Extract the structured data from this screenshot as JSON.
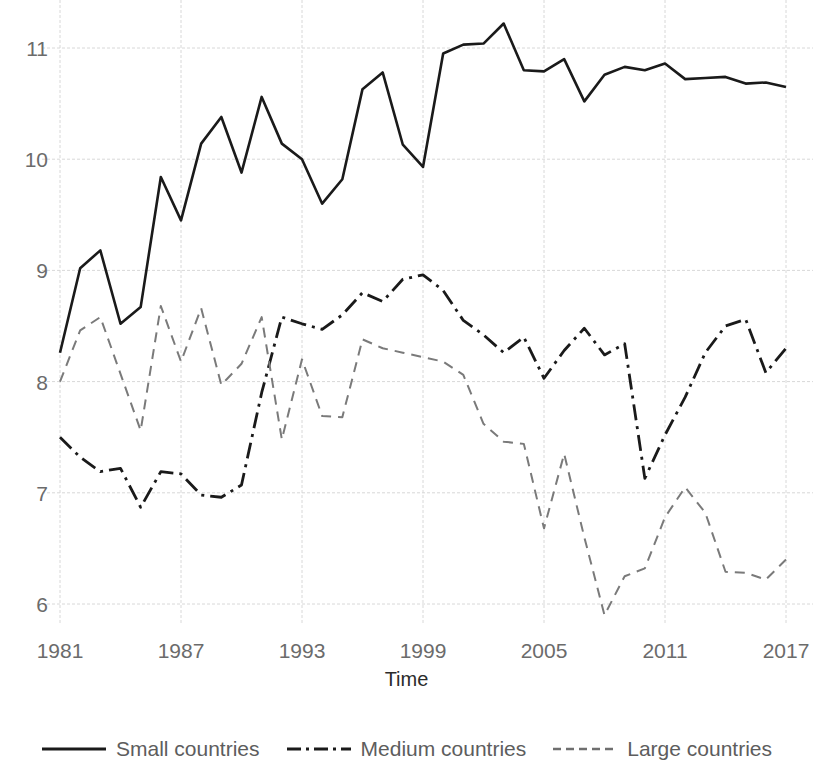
{
  "chart_data": {
    "type": "line",
    "title": "",
    "xlabel": "Time",
    "ylabel": "",
    "xlim": [
      1981,
      2017
    ],
    "ylim": [
      5.75,
      11.4
    ],
    "grid": true,
    "legend_position": "bottom",
    "x_ticks": [
      "1981",
      "1987",
      "1993",
      "1999",
      "2005",
      "2011",
      "2017"
    ],
    "y_ticks": [
      "6",
      "7",
      "8",
      "9",
      "10",
      "11"
    ],
    "x": [
      1981,
      1982,
      1983,
      1984,
      1985,
      1986,
      1987,
      1988,
      1989,
      1990,
      1991,
      1992,
      1993,
      1994,
      1995,
      1996,
      1997,
      1998,
      1999,
      2000,
      2001,
      2002,
      2003,
      2004,
      2005,
      2006,
      2007,
      2008,
      2009,
      2010,
      2011,
      2012,
      2013,
      2014,
      2015,
      2016,
      2017
    ],
    "series": [
      {
        "name": "Small countries",
        "style": "solid",
        "color": "#1a1a1a",
        "values": [
          8.26,
          9.02,
          9.18,
          8.52,
          8.67,
          9.84,
          9.45,
          10.14,
          10.38,
          9.88,
          10.56,
          10.14,
          10.0,
          9.6,
          9.82,
          10.63,
          10.78,
          10.13,
          9.93,
          10.95,
          11.03,
          11.04,
          11.22,
          10.8,
          10.79,
          10.9,
          10.52,
          10.76,
          10.83,
          10.8,
          10.86,
          10.72,
          10.73,
          10.74,
          10.68,
          10.69,
          10.65
        ]
      },
      {
        "name": "Medium countries",
        "style": "dashdot",
        "color": "#1a1a1a",
        "values": [
          7.5,
          7.32,
          7.19,
          7.22,
          6.87,
          7.19,
          7.17,
          6.98,
          6.96,
          7.07,
          7.9,
          8.58,
          8.52,
          8.47,
          8.6,
          8.8,
          8.72,
          8.92,
          8.96,
          8.82,
          8.55,
          8.42,
          8.26,
          8.4,
          8.03,
          8.28,
          8.48,
          8.24,
          8.34,
          7.13,
          7.52,
          7.86,
          8.26,
          8.5,
          8.56,
          8.08,
          8.3
        ]
      },
      {
        "name": "Large countries",
        "style": "dashed",
        "color": "#7a7a7a",
        "values": [
          8.0,
          8.46,
          8.58,
          8.07,
          7.56,
          8.68,
          8.18,
          8.66,
          7.97,
          8.16,
          8.58,
          7.48,
          8.2,
          7.69,
          7.68,
          8.38,
          8.3,
          8.26,
          8.22,
          8.18,
          8.06,
          7.62,
          7.46,
          7.44,
          6.68,
          7.35,
          6.6,
          5.9,
          6.25,
          6.32,
          6.78,
          7.05,
          6.82,
          6.29,
          6.28,
          6.22,
          6.4
        ]
      }
    ]
  },
  "legend": {
    "items": [
      {
        "label": "Small countries",
        "key": "line-solid"
      },
      {
        "label": "Medium countries",
        "key": "line-dashdot"
      },
      {
        "label": "Large countries",
        "key": "line-dashed"
      }
    ]
  },
  "axes": {
    "x_title": "Time"
  }
}
